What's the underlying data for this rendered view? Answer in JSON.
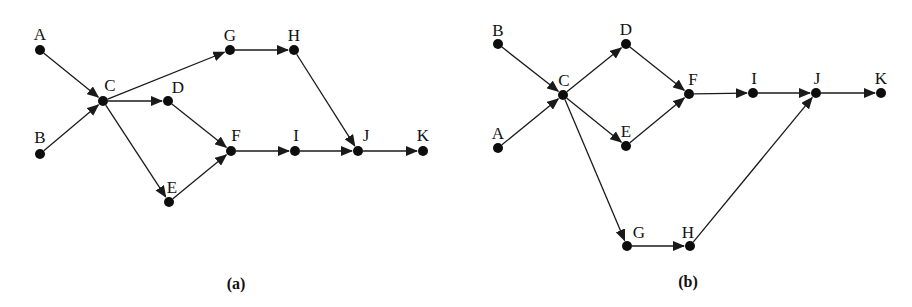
{
  "figures": [
    {
      "id": "a",
      "caption": "(a)",
      "caption_pos": [
        236,
        289
      ],
      "nodes": [
        {
          "id": "A",
          "x": 40,
          "y": 50,
          "lx": 40,
          "ly": 40
        },
        {
          "id": "B",
          "x": 40,
          "y": 154,
          "lx": 40,
          "ly": 143
        },
        {
          "id": "C",
          "x": 103,
          "y": 101,
          "lx": 110,
          "ly": 91
        },
        {
          "id": "D",
          "x": 168,
          "y": 101,
          "lx": 178,
          "ly": 93
        },
        {
          "id": "E",
          "x": 169,
          "y": 202,
          "lx": 172,
          "ly": 193
        },
        {
          "id": "F",
          "x": 231,
          "y": 151,
          "lx": 236,
          "ly": 141
        },
        {
          "id": "G",
          "x": 230,
          "y": 50,
          "lx": 230,
          "ly": 41
        },
        {
          "id": "H",
          "x": 294,
          "y": 50,
          "lx": 294,
          "ly": 41
        },
        {
          "id": "I",
          "x": 295,
          "y": 151,
          "lx": 296,
          "ly": 141
        },
        {
          "id": "J",
          "x": 358,
          "y": 151,
          "lx": 366,
          "ly": 141
        },
        {
          "id": "K",
          "x": 423,
          "y": 151,
          "lx": 423,
          "ly": 141
        }
      ],
      "edges": [
        [
          "A",
          "C"
        ],
        [
          "B",
          "C"
        ],
        [
          "C",
          "G"
        ],
        [
          "C",
          "D"
        ],
        [
          "C",
          "E"
        ],
        [
          "D",
          "F"
        ],
        [
          "E",
          "F"
        ],
        [
          "G",
          "H"
        ],
        [
          "H",
          "J"
        ],
        [
          "F",
          "I"
        ],
        [
          "I",
          "J"
        ],
        [
          "J",
          "K"
        ]
      ]
    },
    {
      "id": "b",
      "caption": "(b)",
      "caption_pos": [
        688,
        287
      ],
      "nodes": [
        {
          "id": "B",
          "x": 498,
          "y": 44,
          "lx": 498,
          "ly": 36
        },
        {
          "id": "A",
          "x": 498,
          "y": 148,
          "lx": 498,
          "ly": 139
        },
        {
          "id": "C",
          "x": 563,
          "y": 95,
          "lx": 564,
          "ly": 86
        },
        {
          "id": "D",
          "x": 626,
          "y": 44,
          "lx": 626,
          "ly": 35
        },
        {
          "id": "E",
          "x": 626,
          "y": 146,
          "lx": 626,
          "ly": 137
        },
        {
          "id": "F",
          "x": 689,
          "y": 94,
          "lx": 693,
          "ly": 85
        },
        {
          "id": "I",
          "x": 753,
          "y": 93,
          "lx": 754,
          "ly": 84
        },
        {
          "id": "J",
          "x": 816,
          "y": 93,
          "lx": 817,
          "ly": 84
        },
        {
          "id": "K",
          "x": 881,
          "y": 93,
          "lx": 881,
          "ly": 84
        },
        {
          "id": "G",
          "x": 627,
          "y": 246,
          "lx": 639,
          "ly": 238
        },
        {
          "id": "H",
          "x": 690,
          "y": 246,
          "lx": 688,
          "ly": 238
        }
      ],
      "edges": [
        [
          "B",
          "C"
        ],
        [
          "A",
          "C"
        ],
        [
          "C",
          "D"
        ],
        [
          "C",
          "E"
        ],
        [
          "C",
          "G"
        ],
        [
          "D",
          "F"
        ],
        [
          "E",
          "F"
        ],
        [
          "F",
          "I"
        ],
        [
          "I",
          "J"
        ],
        [
          "J",
          "K"
        ],
        [
          "G",
          "H"
        ],
        [
          "H",
          "J"
        ]
      ]
    }
  ],
  "style": {
    "node_radius": 5,
    "arrow_color": "#1a1a1a",
    "node_color": "#0d0d0d"
  }
}
